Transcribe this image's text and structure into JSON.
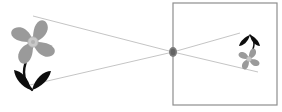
{
  "scene": {
    "title": "Pinhole camera projection diagram",
    "canvas": {
      "width": 282,
      "height": 112
    },
    "background_color": "#ffffff"
  },
  "colors": {
    "petal_gray": "#9a9a9a",
    "petal_gray_light": "#b4b4b4",
    "petal_center": "#c9c9c9",
    "stem_black": "#111111",
    "leaf_black": "#0d0d0d",
    "ray_gray": "#bdbdbd",
    "box_border": "#8e8e8e",
    "pinhole_gray": "#7d7d7d"
  },
  "object_flower": {
    "label": "object-flower",
    "orientation": "upright",
    "center": {
      "x": 33,
      "y": 42
    },
    "petal_count": 4,
    "petal_radius": 23,
    "center_radius": 5,
    "stem_top": {
      "x": 30,
      "y": 46
    },
    "stem_bottom": {
      "x": 31,
      "y": 90
    },
    "leaves": 2
  },
  "pinhole": {
    "label": "pinhole-aperture",
    "x": 173,
    "y": 52,
    "radius_x": 4,
    "radius_y": 5
  },
  "image_box": {
    "label": "camera-back-wall",
    "x": 173,
    "y": 3,
    "width": 104,
    "height": 102,
    "stroke_width": 1.2
  },
  "image_flower": {
    "label": "projected-inverted-flower",
    "orientation": "inverted",
    "center": {
      "x": 249,
      "y": 60
    },
    "petal_count": 4,
    "petal_radius": 11,
    "center_radius": 2.4,
    "stem_top": {
      "x": 248,
      "y": 57
    },
    "stem_bottom": {
      "x": 246,
      "y": 36
    },
    "leaves": 2
  },
  "rays": [
    {
      "label": "ray-top-to-bottom",
      "from": {
        "x": 33,
        "y": 16
      },
      "to": {
        "x": 258,
        "y": 72
      },
      "via": {
        "x": 173,
        "y": 52
      }
    },
    {
      "label": "ray-bottom-to-top",
      "from": {
        "x": 30,
        "y": 85
      },
      "to": {
        "x": 240,
        "y": 33
      },
      "via": {
        "x": 173,
        "y": 52
      }
    }
  ],
  "legend": {
    "object_caption": "",
    "image_caption": ""
  }
}
